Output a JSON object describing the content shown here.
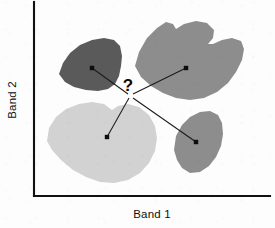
{
  "figure": {
    "width": 275,
    "height": 228,
    "background_color": "#fdfdfd"
  },
  "axes": {
    "x_label": "Band 1",
    "y_label": "Band 2",
    "axis_color": "#111111",
    "origin": {
      "x": 34,
      "y": 196
    },
    "x_axis_end": {
      "x": 270,
      "y": 196
    },
    "y_axis_top": {
      "x": 34,
      "y": 2
    }
  },
  "query_point": {
    "label": "?",
    "x": 128,
    "y": 92,
    "text_x": 128,
    "text_y": 91,
    "color": "#0a0a0a"
  },
  "chart_data": {
    "type": "scatter",
    "title": "",
    "xlabel": "Band 1",
    "ylabel": "Band 2",
    "grid": false,
    "legend": "none",
    "query_label": "?",
    "series": [
      {
        "name": "cluster-dark-gray",
        "fill_color": "#5a5a5a",
        "centroid": {
          "x": 92,
          "y": 68
        },
        "outline": "M 59,74 L 63,63 L 70,53 L 80,45 L 92,40 L 104,38 L 114,40 L 120,46 L 122,56 L 121,66 L 119,76 L 115,84 L 108,89 L 98,91 L 86,90 L 74,87 L 65,82 Z"
      },
      {
        "name": "cluster-medium-gray-large",
        "fill_color": "#8d8d8d",
        "centroid": {
          "x": 186,
          "y": 68
        },
        "outline": "M 135,66 L 139,52 L 147,38 L 157,28 L 166,22 L 173,24 L 176,29 L 184,24 L 196,21 L 207,23 L 214,30 L 213,38 L 208,44 L 213,44 L 222,40 L 232,38 L 241,41 L 244,49 L 242,60 L 236,72 L 228,83 L 217,92 L 204,98 L 190,100 L 176,98 L 163,93 L 151,86 L 141,77 Z"
      },
      {
        "name": "cluster-light-gray",
        "fill_color": "#d2d2d2",
        "centroid": {
          "x": 107,
          "y": 137
        },
        "outline": "M 47,141 L 49,128 L 56,117 L 66,109 L 79,104 L 92,102 L 104,104 L 112,110 L 118,106 L 128,104 L 139,107 L 149,115 L 155,126 L 157,138 L 155,151 L 149,163 L 140,173 L 128,180 L 114,183 L 100,182 L 86,177 L 73,170 L 61,160 L 52,150 Z"
      },
      {
        "name": "cluster-medium-gray-small",
        "fill_color": "#8d8d8d",
        "centroid": {
          "x": 196,
          "y": 142
        },
        "outline": "M 174,150 L 176,136 L 182,125 L 190,117 L 200,112 L 210,111 L 218,115 L 222,123 L 223,134 L 221,146 L 216,157 L 209,166 L 200,172 L 190,173 L 182,168 L 177,160 Z"
      }
    ],
    "connectors": [
      {
        "name": "connector-to-dark-gray",
        "from": {
          "x": 128,
          "y": 94
        },
        "to": {
          "x": 92,
          "y": 68
        }
      },
      {
        "name": "connector-to-medium-gray-large",
        "from": {
          "x": 133,
          "y": 94
        },
        "to": {
          "x": 186,
          "y": 68
        }
      },
      {
        "name": "connector-to-light-gray",
        "from": {
          "x": 129,
          "y": 98
        },
        "to": {
          "x": 107,
          "y": 137
        }
      },
      {
        "name": "connector-to-medium-gray-small",
        "from": {
          "x": 133,
          "y": 98
        },
        "to": {
          "x": 196,
          "y": 142
        }
      }
    ]
  }
}
